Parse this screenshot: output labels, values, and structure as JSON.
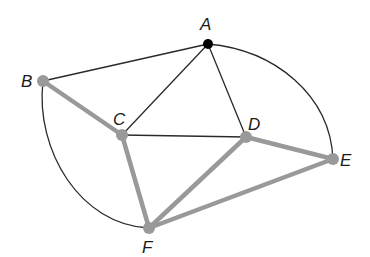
{
  "diagram": {
    "type": "graph",
    "colors": {
      "background": "#ffffff",
      "thin_edge": "#2a2a2a",
      "highlight_edge": "#999999",
      "highlight_node": "#999999",
      "start_node": "#000000"
    },
    "vertices": [
      {
        "id": "A",
        "label": "A",
        "x": 208,
        "y": 44,
        "style": "black",
        "label_x": 200,
        "label_y": 30
      },
      {
        "id": "B",
        "label": "B",
        "x": 43,
        "y": 81,
        "style": "gray",
        "label_x": 21,
        "label_y": 87
      },
      {
        "id": "C",
        "label": "C",
        "x": 122,
        "y": 135,
        "style": "gray",
        "label_x": 113,
        "label_y": 125
      },
      {
        "id": "D",
        "label": "D",
        "x": 246,
        "y": 137,
        "style": "gray",
        "label_x": 248,
        "label_y": 130
      },
      {
        "id": "E",
        "label": "E",
        "x": 333,
        "y": 159,
        "style": "gray",
        "label_x": 340,
        "label_y": 166
      },
      {
        "id": "F",
        "label": "F",
        "x": 149,
        "y": 228,
        "style": "gray",
        "label_x": 142,
        "label_y": 253
      }
    ],
    "edges": [
      {
        "from": "A",
        "to": "B",
        "highlighted": false,
        "curved": false
      },
      {
        "from": "A",
        "to": "C",
        "highlighted": false,
        "curved": false
      },
      {
        "from": "A",
        "to": "D",
        "highlighted": false,
        "curved": false
      },
      {
        "from": "A",
        "to": "E",
        "highlighted": false,
        "curved": true
      },
      {
        "from": "B",
        "to": "F",
        "highlighted": false,
        "curved": true
      },
      {
        "from": "C",
        "to": "D",
        "highlighted": false,
        "curved": false
      },
      {
        "from": "B",
        "to": "C",
        "highlighted": true,
        "curved": false
      },
      {
        "from": "C",
        "to": "F",
        "highlighted": true,
        "curved": false
      },
      {
        "from": "F",
        "to": "D",
        "highlighted": true,
        "curved": false
      },
      {
        "from": "D",
        "to": "E",
        "highlighted": true,
        "curved": false
      },
      {
        "from": "F",
        "to": "E",
        "highlighted": true,
        "curved": false
      }
    ]
  }
}
